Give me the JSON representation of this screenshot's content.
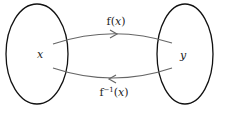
{
  "diagram": {
    "domain_set": {
      "label": "x"
    },
    "codomain_set": {
      "label": "y"
    },
    "forward_map": {
      "label_prefix": "f(",
      "var": "x",
      "label_suffix": ")"
    },
    "inverse_map": {
      "label_prefix": "f",
      "sup": "−1",
      "label_open": "(",
      "var": "x",
      "label_suffix": ")"
    },
    "colors": {
      "ellipse": "#111111",
      "arrow": "#666666",
      "text": "#222222"
    }
  }
}
